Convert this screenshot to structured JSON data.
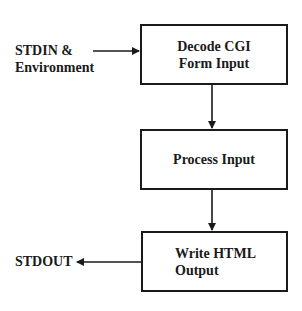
{
  "diagram": {
    "type": "flowchart",
    "inputs": {
      "stdin_line1": "STDIN &",
      "stdin_line2": "Environment"
    },
    "outputs": {
      "stdout": "STDOUT"
    },
    "boxes": [
      {
        "id": "decode",
        "line1": "Decode CGI",
        "line2": "Form Input"
      },
      {
        "id": "process",
        "line1": "Process Input"
      },
      {
        "id": "write",
        "line1": "Write HTML",
        "line2": "Output"
      }
    ],
    "edges": [
      {
        "from": "STDIN & Environment",
        "to": "Decode CGI Form Input"
      },
      {
        "from": "Decode CGI Form Input",
        "to": "Process Input"
      },
      {
        "from": "Process Input",
        "to": "Write HTML Output"
      },
      {
        "from": "Write HTML Output",
        "to": "STDOUT"
      }
    ],
    "colors": {
      "stroke": "#1a1a1a",
      "background": "#ffffff"
    }
  }
}
